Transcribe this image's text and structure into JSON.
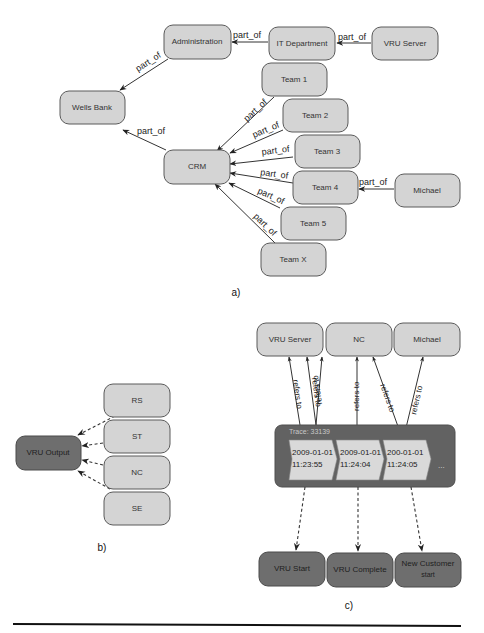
{
  "diagram_a": {
    "caption": "a)",
    "nodes": {
      "administration": "Administration",
      "it_department": "IT Department",
      "vru_server": "VRU Server",
      "wells_bank": "Wells Bank",
      "crm": "CRM",
      "team1": "Team 1",
      "team2": "Team 2",
      "team3": "Team 3",
      "team4": "Team 4",
      "team5": "Team 5",
      "teamx": "Team X",
      "michael": "Michael"
    },
    "edge_label": "part_of",
    "edges": [
      {
        "from": "VRU Server",
        "to": "IT Department",
        "label": "part_of"
      },
      {
        "from": "IT Department",
        "to": "Administration",
        "label": "part_of"
      },
      {
        "from": "Administration",
        "to": "Wells Bank",
        "label": "part_of"
      },
      {
        "from": "CRM",
        "to": "Wells Bank",
        "label": "part_of"
      },
      {
        "from": "Team 1",
        "to": "CRM",
        "label": "part_of"
      },
      {
        "from": "Team 2",
        "to": "CRM",
        "label": "part_of"
      },
      {
        "from": "Team 3",
        "to": "CRM",
        "label": "part_of"
      },
      {
        "from": "Team 4",
        "to": "CRM",
        "label": "part_of"
      },
      {
        "from": "Team 5",
        "to": "CRM",
        "label": "part_of"
      },
      {
        "from": "Team X",
        "to": "CRM",
        "label": "part_of"
      },
      {
        "from": "Michael",
        "to": "Team 4",
        "label": "part_of"
      }
    ]
  },
  "diagram_b": {
    "caption": "b)",
    "nodes": {
      "vru_output": "VRU Output",
      "rs": "RS",
      "st": "ST",
      "nc": "NC",
      "se": "SE"
    }
  },
  "diagram_c": {
    "caption": "c)",
    "top_nodes": {
      "vru_server": "VRU Server",
      "nc": "NC",
      "michael": "Michael"
    },
    "edge_label": "refers to",
    "trace": {
      "title": "Trace: 33139",
      "events": [
        {
          "date": "2009-01-01",
          "time": "11:23:55"
        },
        {
          "date": "2009-01-01",
          "time": "11:24:04"
        },
        {
          "date": "200-01-01",
          "time": "11:24:05"
        }
      ],
      "ellipsis": "..."
    },
    "bottom_nodes": {
      "vru_start": "VRU Start",
      "vru_complete": "VRU Complete",
      "new_customer_line1": "New Customer",
      "new_customer_line2": "start"
    }
  }
}
